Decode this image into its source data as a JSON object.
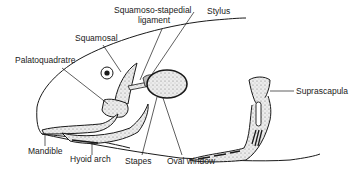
{
  "figure": {
    "type": "anatomical-diagram",
    "colors": {
      "line": "#1a1a1a",
      "bone_fill": "#d9d9d9",
      "background": "#ffffff"
    }
  },
  "labels": {
    "squamoso_stapedial_1": "Squamoso-stapedial",
    "squamoso_stapedial_2": "ligament",
    "stylus": "Stylus",
    "squamosal": "Squamosal",
    "palatoquadrate": "Palatoquadratre",
    "suprascapula": "Suprascapula",
    "mandible": "Mandible",
    "hyoid_arch": "Hyoid arch",
    "stapes": "Stapes",
    "oval_window": "Oval window"
  }
}
